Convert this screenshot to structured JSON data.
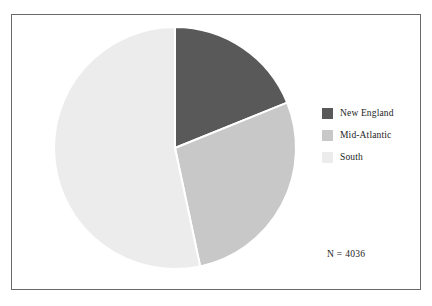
{
  "figure": {
    "background_color": "#ffffff",
    "frame_color": "#6a6a6a",
    "n_label": "N = 4036"
  },
  "legend": {
    "position": "right",
    "entries": [
      {
        "label": "New England",
        "color": "#595959"
      },
      {
        "label": "Mid-Atlantic",
        "color": "#c8c8c8"
      },
      {
        "label": "South",
        "color": "#ececec"
      }
    ]
  },
  "chart_data": {
    "type": "pie",
    "title": "",
    "subtitle": "",
    "xlabel": "",
    "ylabel": "",
    "grid": false,
    "legend_position": "right",
    "total_n": 4036,
    "annotations": [
      "N = 4036"
    ],
    "start_angle_deg": 0,
    "direction": "clockwise",
    "center": {
      "x": 175,
      "y": 148
    },
    "radius": 121,
    "wedge_edge_color": "#ffffff",
    "wedge_edge_width": 2,
    "categories": [
      "New England",
      "Mid-Atlantic",
      "South"
    ],
    "values": [
      19,
      28,
      53
    ],
    "percentages": [
      19,
      28,
      53
    ],
    "counts": [
      767,
      1130,
      2139
    ],
    "colors": [
      "#595959",
      "#c8c8c8",
      "#ececec"
    ],
    "slices": [
      {
        "label": "New England",
        "color": "#595959",
        "percent": 19,
        "count": 767,
        "start_angle_deg": 0,
        "end_angle_deg": 68
      },
      {
        "label": "Mid-Atlantic",
        "color": "#c8c8c8",
        "percent": 28,
        "count": 1130,
        "start_angle_deg": 68,
        "end_angle_deg": 168
      },
      {
        "label": "South",
        "color": "#ececec",
        "percent": 53,
        "count": 2139,
        "start_angle_deg": 168,
        "end_angle_deg": 360
      }
    ]
  }
}
